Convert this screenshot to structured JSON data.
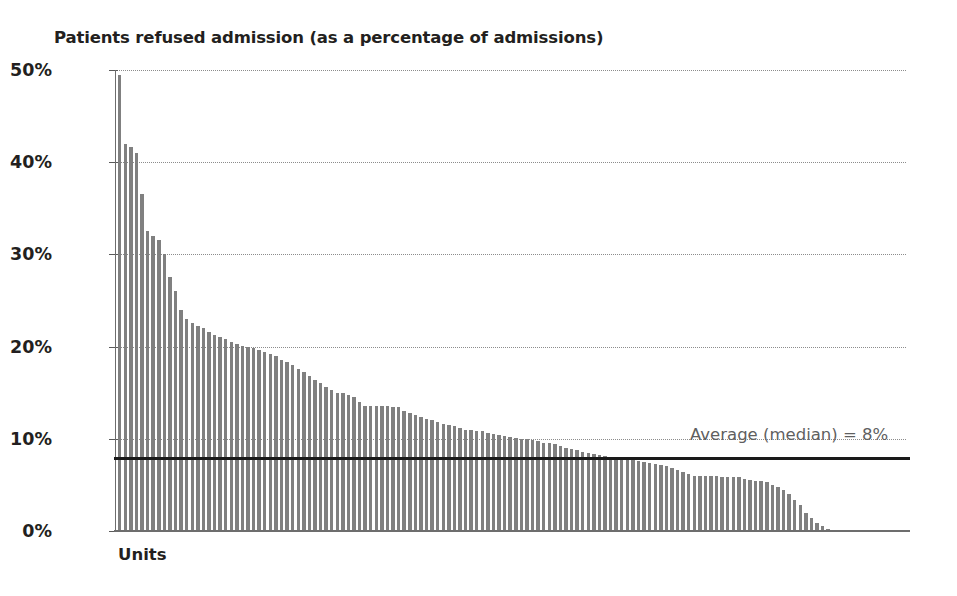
{
  "chart_data": {
    "type": "bar",
    "title": "Patients refused admission (as a percentage of admissions)",
    "xlabel": "Units",
    "ylabel": "",
    "ylim": [
      0,
      50
    ],
    "grid": true,
    "legend": "none",
    "y_ticks": [
      {
        "value": 50,
        "label": "50%"
      },
      {
        "value": 40,
        "label": "40%"
      },
      {
        "value": 30,
        "label": "30%"
      },
      {
        "value": 20,
        "label": "20%"
      },
      {
        "value": 10,
        "label": "10%"
      },
      {
        "value": 0,
        "label": "0%"
      }
    ],
    "annotations": [
      {
        "name": "median-reference",
        "text": "Average (median) = 8%",
        "value": 8,
        "style": "solid-black-line"
      }
    ],
    "bar_color": "#808080",
    "series_name": "Patients refused admission (%)",
    "categories_note": "Individual units, sorted descending; x tick labels not shown",
    "n_bars": 128,
    "values": [
      49.5,
      42.0,
      41.6,
      41.0,
      36.5,
      32.5,
      32.0,
      31.6,
      30.0,
      27.6,
      26.0,
      24.0,
      23.0,
      22.6,
      22.2,
      22.0,
      21.6,
      21.3,
      21.0,
      20.8,
      20.5,
      20.3,
      20.1,
      20.0,
      19.8,
      19.6,
      19.4,
      19.2,
      19.0,
      18.6,
      18.3,
      18.0,
      17.6,
      17.2,
      16.8,
      16.4,
      16.0,
      15.6,
      15.3,
      15.0,
      15.0,
      14.8,
      14.5,
      14.0,
      13.6,
      13.6,
      13.6,
      13.6,
      13.6,
      13.5,
      13.5,
      13.0,
      12.8,
      12.6,
      12.4,
      12.2,
      12.0,
      11.8,
      11.6,
      11.5,
      11.4,
      11.2,
      11.0,
      11.0,
      10.9,
      10.8,
      10.6,
      10.5,
      10.4,
      10.3,
      10.2,
      10.1,
      10.0,
      10.0,
      9.9,
      9.8,
      9.6,
      9.5,
      9.4,
      9.2,
      9.0,
      8.9,
      8.8,
      8.6,
      8.5,
      8.4,
      8.2,
      8.1,
      8.0,
      8.0,
      7.9,
      7.8,
      7.7,
      7.6,
      7.5,
      7.4,
      7.3,
      7.2,
      7.0,
      6.8,
      6.6,
      6.4,
      6.2,
      6.0,
      6.0,
      6.0,
      6.0,
      6.0,
      5.9,
      5.9,
      5.9,
      5.9,
      5.6,
      5.5,
      5.4,
      5.4,
      5.3,
      5.0,
      4.8,
      4.4,
      4.0,
      3.4,
      2.8,
      2.0,
      1.4,
      0.9,
      0.5,
      0.2
    ]
  }
}
